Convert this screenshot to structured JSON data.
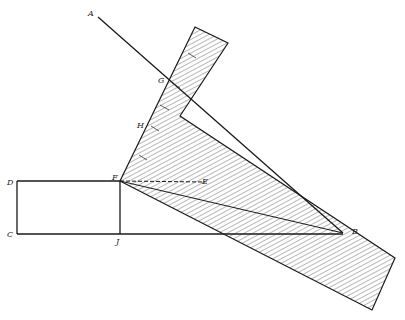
{
  "figure": {
    "labels": {
      "A": "A",
      "B": "B",
      "C": "C",
      "D": "D",
      "E": "E",
      "F": "F",
      "G": "G",
      "H": "H",
      "J": "J"
    },
    "colors": {
      "line": "#1a1a1a",
      "hatch": "#333333",
      "background": "#ffffff"
    }
  }
}
